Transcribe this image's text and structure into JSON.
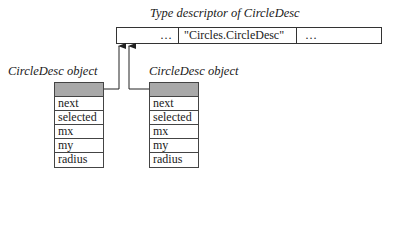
{
  "descriptor": {
    "title": "Type descriptor of CircleDesc",
    "cells": [
      "…",
      "\"Circles.CircleDesc\"",
      "…"
    ]
  },
  "objects": [
    {
      "label": "CircleDesc object",
      "fields": [
        "next",
        "selected",
        "mx",
        "my",
        "radius"
      ]
    },
    {
      "label": "CircleDesc object",
      "fields": [
        "next",
        "selected",
        "mx",
        "my",
        "radius"
      ]
    }
  ],
  "colors": {
    "header_fill": "#a9a9a9",
    "line": "#333333"
  }
}
